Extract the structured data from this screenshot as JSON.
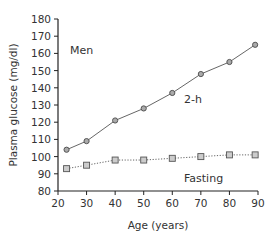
{
  "chart_data": {
    "type": "line",
    "title": "",
    "xlabel": "Age (years)",
    "ylabel": "Plasma glucose (mg/dl)",
    "xlim": [
      20,
      90
    ],
    "ylim": [
      80,
      180
    ],
    "xticks": [
      20,
      30,
      40,
      50,
      60,
      70,
      80,
      90
    ],
    "yticks": [
      80,
      90,
      100,
      110,
      120,
      130,
      140,
      150,
      160,
      170,
      180
    ],
    "grid": false,
    "legend": "none (inline annotations)",
    "annotations": [
      {
        "text": "Men",
        "x": 25,
        "y": 160
      },
      {
        "text": "2-h",
        "x": 66,
        "y": 134
      },
      {
        "text": "Fasting",
        "x": 66,
        "y": 89
      }
    ],
    "series": [
      {
        "name": "2-h",
        "marker": "circle",
        "line": "solid",
        "x": [
          23,
          30,
          40,
          50,
          60,
          70,
          80,
          89
        ],
        "values": [
          104,
          109,
          121,
          128,
          137,
          148,
          155,
          165
        ]
      },
      {
        "name": "Fasting",
        "marker": "square",
        "line": "dotted",
        "x": [
          23,
          30,
          40,
          50,
          60,
          70,
          80,
          89
        ],
        "values": [
          93,
          95,
          98,
          98,
          99,
          100,
          101,
          101
        ]
      }
    ]
  },
  "colors": {
    "axis": "#222222",
    "line": "#555555",
    "marker_fill": "#aaaaaa",
    "marker_stroke": "#555555",
    "text": "#333333"
  }
}
